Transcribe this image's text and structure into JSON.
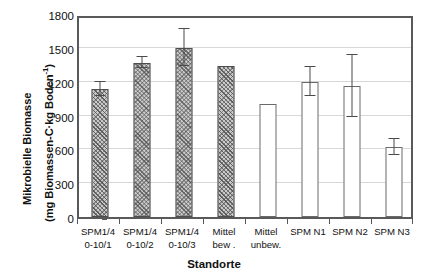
{
  "chart_data": {
    "type": "bar",
    "title": "",
    "xlabel": "Standorte",
    "ylabel_line1": "Mikrobielle Biomasse",
    "ylabel_line2_prefix": "(mg Biomassen-C·kg Boden",
    "ylabel_line2_sup": "-1",
    "ylabel_line2_suffix": ")",
    "categories": [
      "SPM1/4 0-10/1",
      "SPM1/4 0-10/2",
      "SPM1/4 0-10/3",
      "Mittel bew.",
      "Mittel unbew.",
      "SPM N1",
      "SPM N2",
      "SPM N3"
    ],
    "category_lines": [
      [
        "SPM1/4",
        "0-10/1"
      ],
      [
        "SPM1/4",
        "0-10/2"
      ],
      [
        "SPM1/4",
        "0-10/3"
      ],
      [
        "Mittel",
        "bew ."
      ],
      [
        "Mittel",
        "unbew."
      ],
      [
        "SPM N1",
        ""
      ],
      [
        "SPM N2",
        ""
      ],
      [
        "SPM N3",
        ""
      ]
    ],
    "values": [
      1135,
      1370,
      1500,
      1335,
      1000,
      1200,
      1160,
      620
    ],
    "errors": [
      60,
      45,
      165,
      0,
      0,
      130,
      275,
      70
    ],
    "bar_styles": [
      "hatched",
      "hatched",
      "hatched",
      "hatched",
      "open",
      "open",
      "open",
      "open"
    ],
    "yticks": [
      0,
      300,
      600,
      900,
      1200,
      1500,
      1800
    ],
    "ytick_labels": [
      "0",
      "300",
      "600",
      "900",
      "1200",
      "1500",
      "1800"
    ],
    "ylim": [
      0,
      1800
    ],
    "grid": true,
    "legend": "none",
    "colors": {
      "bar_hatch_fill": "#c9c9c9",
      "bar_open_fill": "#ffffff",
      "bar_edge": "#4d4d4d",
      "axis": "#58595b",
      "grid": "#d7d7d7",
      "text": "#111111"
    }
  }
}
